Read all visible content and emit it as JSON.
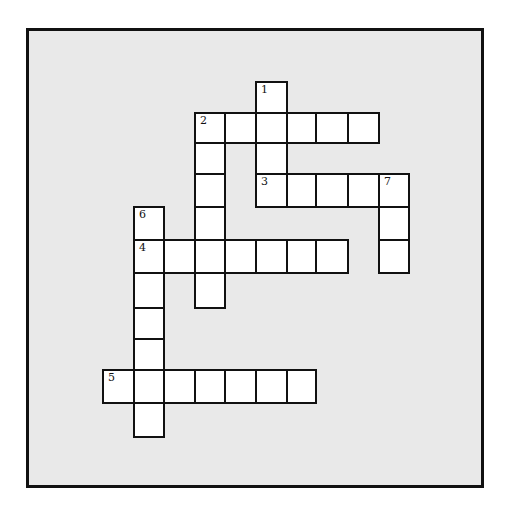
{
  "puzzle": {
    "type": "crossword",
    "colors": {
      "page_bg": "#ffffff",
      "board_bg": "#e9e9e9",
      "cell_bg": "#ffffff",
      "line": "#111111"
    },
    "col_x": [
      103,
      134,
      164,
      195,
      225,
      256,
      287,
      316,
      348,
      379,
      409
    ],
    "row_y": [
      82,
      113,
      143,
      174,
      207,
      240,
      273,
      308,
      339,
      370,
      403,
      437
    ],
    "entries": [
      {
        "number": "1",
        "direction": "down",
        "row": 0,
        "col": 5,
        "length": 4
      },
      {
        "number": "2",
        "direction": "across",
        "row": 1,
        "col": 3,
        "length": 6
      },
      {
        "number": "2",
        "direction": "down",
        "row": 1,
        "col": 3,
        "length": 6
      },
      {
        "number": "3",
        "direction": "across",
        "row": 3,
        "col": 5,
        "length": 5
      },
      {
        "number": "7",
        "direction": "down",
        "row": 3,
        "col": 9,
        "length": 3
      },
      {
        "number": "6",
        "direction": "down",
        "row": 4,
        "col": 1,
        "length": 7
      },
      {
        "number": "4",
        "direction": "across",
        "row": 5,
        "col": 1,
        "length": 7
      },
      {
        "number": "5",
        "direction": "across",
        "row": 9,
        "col": 0,
        "length": 7
      }
    ]
  }
}
